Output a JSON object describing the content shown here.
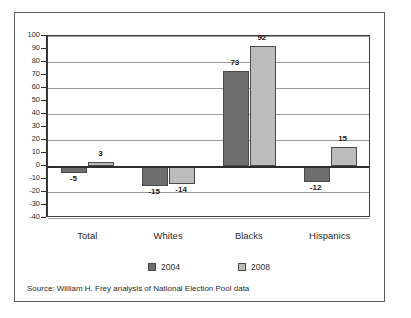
{
  "chart_data": {
    "type": "bar",
    "title": "",
    "subtitle": "",
    "xlabel": "",
    "ylabel": "",
    "categories": [
      "Total",
      "Whites",
      "Blacks",
      "Hispanics"
    ],
    "series": [
      {
        "name": "2004",
        "color": "#6e6e6e",
        "values": [
          -5,
          -15,
          73,
          -12
        ]
      },
      {
        "name": "2008",
        "color": "#bcbcbc",
        "values": [
          3,
          -14,
          92,
          15
        ]
      }
    ],
    "ylim": [
      -40,
      100
    ],
    "ytick_step": 10,
    "yticks": [
      100,
      90,
      80,
      70,
      60,
      50,
      40,
      30,
      20,
      10,
      0,
      -10,
      -20,
      -30,
      -40
    ],
    "ytick_labels": [
      "100",
      "90",
      "80",
      "70",
      "60",
      "50",
      "40",
      "30",
      "20",
      "10",
      "0",
      "-10",
      "-20",
      "-30",
      "-40"
    ],
    "gridline_values": [
      100,
      80,
      60,
      40,
      20,
      0,
      -20,
      -40
    ],
    "grid": true,
    "legend_position": "bottom",
    "bar_labels": {
      "2004": [
        "-5",
        "-15",
        "73",
        "-12"
      ],
      "2008": [
        "3",
        "-14",
        "92",
        "15"
      ]
    }
  },
  "source": {
    "text": "Source: William H. Frey analysis of National Election Pool data"
  },
  "legend": {
    "entries": [
      {
        "label": "2004"
      },
      {
        "label": "2008"
      }
    ]
  },
  "colors": {
    "series_2004": "#6e6e6e",
    "series_2008": "#bcbcbc",
    "frame": "#5c5c5c",
    "axis": "#2b2b2b",
    "grid": "#9a9a9a",
    "background": "#ffffff"
  }
}
